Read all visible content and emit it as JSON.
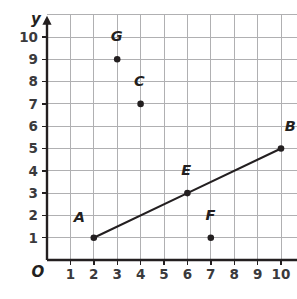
{
  "figure": {
    "type": "coordinate-plane-scatter-with-line",
    "background_color": "#ffffff",
    "grid_color": "#b0b0b2",
    "axis_color": "#231f20",
    "origin_label": "O",
    "x_axis": {
      "label": "x",
      "ticks": [
        "1",
        "2",
        "3",
        "4",
        "5",
        "6",
        "7",
        "8",
        "9",
        "10"
      ],
      "min": 0,
      "max": 11
    },
    "y_axis": {
      "label": "y",
      "ticks": [
        "1",
        "2",
        "3",
        "4",
        "5",
        "6",
        "7",
        "8",
        "9",
        "10"
      ],
      "min": 0,
      "max": 11
    }
  },
  "chart_data": {
    "type": "scatter",
    "title": "",
    "xlabel": "x",
    "ylabel": "y",
    "xlim": [
      0,
      11
    ],
    "ylim": [
      0,
      11
    ],
    "grid": true,
    "legend": "none",
    "points": [
      {
        "label": "A",
        "x": 2,
        "y": 1,
        "label_dx": -0.62,
        "label_dy": 0.7
      },
      {
        "label": "B",
        "x": 10,
        "y": 5,
        "label_dx": 0.4,
        "label_dy": 0.78
      },
      {
        "label": "C",
        "x": 4,
        "y": 7,
        "label_dx": -0.05,
        "label_dy": 0.8
      },
      {
        "label": "E",
        "x": 6,
        "y": 3,
        "label_dx": -0.05,
        "label_dy": 0.8
      },
      {
        "label": "F",
        "x": 7,
        "y": 1,
        "label_dx": -0.02,
        "label_dy": 0.8
      },
      {
        "label": "G",
        "x": 3,
        "y": 9,
        "label_dx": -0.02,
        "label_dy": 0.82
      }
    ],
    "series": [
      {
        "name": "line-AB",
        "type": "line",
        "slope": 0.5,
        "points": [
          {
            "x": 2,
            "y": 1
          },
          {
            "x": 6,
            "y": 3
          },
          {
            "x": 10,
            "y": 5
          }
        ]
      }
    ]
  }
}
